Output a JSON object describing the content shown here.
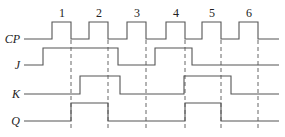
{
  "diagram": {
    "type": "timing-diagram",
    "pulse_numbers": [
      "1",
      "2",
      "3",
      "4",
      "5",
      "6"
    ],
    "signals": [
      {
        "name": "CP",
        "low_y": 39,
        "high_y": 22,
        "edges": [
          24,
          52,
          71,
          89,
          108,
          127,
          146,
          166,
          185,
          202,
          221,
          239,
          258,
          279
        ],
        "start": 0
      },
      {
        "name": "J",
        "low_y": 65,
        "high_y": 48,
        "edges": [
          24,
          43,
          118,
          155,
          192,
          279
        ],
        "start": 0
      },
      {
        "name": "K",
        "low_y": 94,
        "high_y": 76,
        "edges": [
          24,
          80,
          120,
          184,
          231,
          279
        ],
        "start": 0
      },
      {
        "name": "Q",
        "low_y": 121,
        "high_y": 103,
        "edges": [
          24,
          71,
          108,
          185,
          221,
          279
        ],
        "start": 0
      }
    ],
    "pulse_label_x": [
      62,
      99,
      137,
      176,
      212,
      249
    ],
    "dashed_lines_x": [
      71,
      108,
      146,
      185,
      221,
      258
    ],
    "dashed_top": 40,
    "dashed_bottom": 128,
    "line_color": "#555555"
  }
}
